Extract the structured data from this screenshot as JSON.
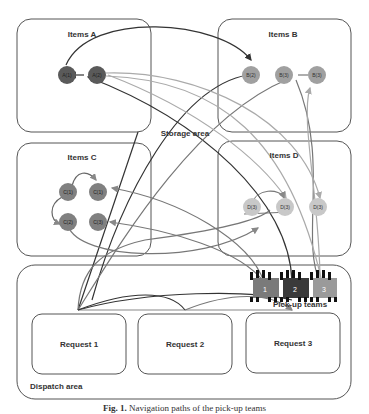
{
  "diagram": {
    "storage_area_label": "Storage area",
    "dispatch_area_label": "Dispatch area",
    "pickup_teams_label": "Pick-up teams",
    "groups": [
      {
        "label": "Items A",
        "nodes": [
          "A(1)",
          "A(2)"
        ],
        "color": "#5a5a5a"
      },
      {
        "label": "Items B",
        "nodes": [
          "B(2)",
          "B(3)",
          "B(3)"
        ],
        "color": "#a0a0a0"
      },
      {
        "label": "Items C",
        "nodes": [
          "C(1)",
          "C(1)",
          "C(2)",
          "C(3)"
        ],
        "color": "#808080"
      },
      {
        "label": "Items D",
        "nodes": [
          "D(3)",
          "D(3)",
          "D(3)"
        ],
        "color": "#c8c8c8"
      }
    ],
    "requests": [
      "Request 1",
      "Request 2",
      "Request 3"
    ],
    "teams": [
      {
        "label": "1",
        "color": "#7a7a7a"
      },
      {
        "label": "2",
        "color": "#3a3a3a"
      },
      {
        "label": "3",
        "color": "#9a9a9a"
      }
    ]
  },
  "caption": {
    "prefix": "Fig. 1.",
    "text": "Navigation paths of the pick-up teams"
  }
}
